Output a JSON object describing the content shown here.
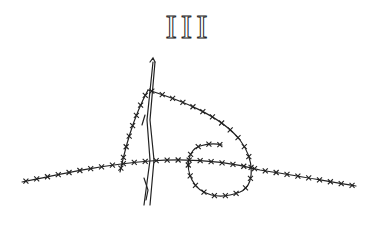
{
  "title": "III",
  "illustration": {
    "subject": "barbed-wire",
    "stroke_color": "#222222",
    "background_color": "#ffffff"
  }
}
